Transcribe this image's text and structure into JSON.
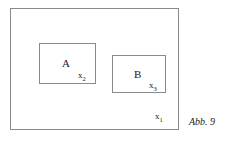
{
  "figure": {
    "caption": "Abb. 9",
    "stroke_color": "#8a8a8a",
    "text_color": "#1a1a1a",
    "background_color": "#ffffff"
  },
  "outer_set": {
    "name": "X1",
    "element_label_base": "x",
    "element_label_sub": "1"
  },
  "set_a": {
    "letter": "A",
    "element_label_base": "x",
    "element_label_sub": "2"
  },
  "set_b": {
    "letter": "B",
    "element_label_base": "x",
    "element_label_sub": "3"
  }
}
